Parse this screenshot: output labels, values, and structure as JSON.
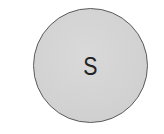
{
  "badge": {
    "letter": "S",
    "fill_color": "#d4d4d4",
    "border_color": "#5a5a5a",
    "text_color": "#222222"
  }
}
